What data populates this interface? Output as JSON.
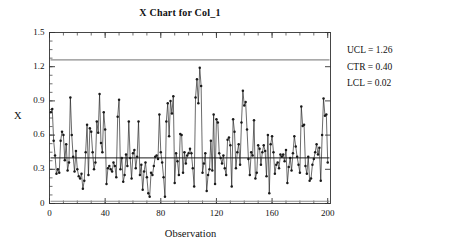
{
  "chart_data": {
    "type": "line",
    "title": "X Chart for Col_1",
    "xlabel": "Observation",
    "ylabel": "X",
    "xlim": [
      0,
      202
    ],
    "ylim": [
      0,
      1.5
    ],
    "grid": false,
    "legend": "none",
    "xticks": [
      0,
      40,
      80,
      120,
      160,
      200
    ],
    "xtick_labels": [
      "0",
      "40",
      "80",
      "120",
      "160",
      "200"
    ],
    "yticks": [
      0,
      0.3,
      0.6,
      0.9,
      1.2,
      1.5
    ],
    "ytick_labels": [
      "0",
      "0.3",
      "0.6",
      "0.9",
      "1.2",
      "1.5"
    ],
    "x_minor_tick_step": 10,
    "y_minor_tick_step": 0.075,
    "control_lines": [
      {
        "name": "UCL",
        "label": "UCL = 1.26",
        "value": 1.26,
        "color": "#8c8c8c"
      },
      {
        "name": "CTR",
        "label": "CTR = 0.40",
        "value": 0.4,
        "color": "#1a1a1a"
      },
      {
        "name": "LCL",
        "label": "LCL = 0.02",
        "value": 0.02,
        "color": "#8c8c8c"
      }
    ],
    "series": [
      {
        "name": "Col_1",
        "marker": "filled-circle",
        "color": "#1a1a1a",
        "x": [
          1,
          2,
          3,
          4,
          5,
          6,
          7,
          8,
          9,
          10,
          11,
          12,
          13,
          14,
          15,
          16,
          17,
          18,
          19,
          20,
          21,
          22,
          23,
          24,
          25,
          26,
          27,
          28,
          29,
          30,
          31,
          32,
          33,
          34,
          35,
          36,
          37,
          38,
          39,
          40,
          41,
          42,
          43,
          44,
          45,
          46,
          47,
          48,
          49,
          50,
          51,
          52,
          53,
          54,
          55,
          56,
          57,
          58,
          59,
          60,
          61,
          62,
          63,
          64,
          65,
          66,
          67,
          68,
          69,
          70,
          71,
          72,
          73,
          74,
          75,
          76,
          77,
          78,
          79,
          80,
          81,
          82,
          83,
          84,
          85,
          86,
          87,
          88,
          89,
          90,
          91,
          92,
          93,
          94,
          95,
          96,
          97,
          98,
          99,
          100,
          101,
          102,
          103,
          104,
          105,
          106,
          107,
          108,
          109,
          110,
          111,
          112,
          113,
          114,
          115,
          116,
          117,
          118,
          119,
          120,
          121,
          122,
          123,
          124,
          125,
          126,
          127,
          128,
          129,
          130,
          131,
          132,
          133,
          134,
          135,
          136,
          137,
          138,
          139,
          140,
          141,
          142,
          143,
          144,
          145,
          146,
          147,
          148,
          149,
          150,
          151,
          152,
          153,
          154,
          155,
          156,
          157,
          158,
          159,
          160,
          161,
          162,
          163,
          164,
          165,
          166,
          167,
          168,
          169,
          170,
          171,
          172,
          173,
          174,
          175,
          176,
          177,
          178,
          179,
          180,
          181,
          182,
          183,
          184,
          185,
          186,
          187,
          188,
          189,
          190,
          191,
          192,
          193,
          194,
          195,
          196,
          197,
          198,
          199,
          200
        ],
        "values": [
          0.8,
          0.83,
          0.55,
          0.42,
          0.26,
          0.3,
          0.27,
          0.55,
          0.63,
          0.6,
          0.38,
          0.52,
          0.29,
          0.36,
          0.93,
          0.6,
          0.41,
          0.28,
          0.46,
          0.3,
          0.24,
          0.22,
          0.26,
          0.13,
          0.2,
          0.45,
          0.69,
          0.25,
          0.66,
          0.63,
          0.45,
          0.3,
          0.36,
          0.72,
          0.62,
          0.96,
          0.53,
          0.45,
          0.8,
          0.65,
          0.17,
          0.31,
          0.33,
          0.3,
          0.28,
          0.36,
          0.33,
          0.23,
          0.76,
          0.91,
          0.3,
          0.4,
          0.19,
          0.25,
          0.43,
          0.33,
          0.72,
          0.4,
          0.22,
          0.44,
          0.47,
          0.31,
          0.41,
          0.72,
          0.25,
          0.34,
          0.12,
          0.28,
          0.36,
          0.23,
          0.09,
          0.06,
          0.27,
          0.25,
          0.33,
          0.41,
          0.42,
          0.39,
          0.78,
          0.45,
          0.36,
          0.23,
          0.06,
          0.72,
          0.88,
          0.59,
          0.9,
          0.79,
          0.94,
          0.18,
          0.44,
          0.37,
          0.25,
          0.61,
          0.6,
          0.27,
          0.45,
          0.35,
          0.42,
          0.44,
          0.48,
          0.44,
          0.31,
          0.15,
          0.93,
          1.09,
          0.88,
          1.19,
          1.03,
          0.27,
          0.35,
          0.44,
          0.11,
          0.25,
          0.3,
          0.55,
          0.29,
          0.78,
          0.17,
          0.74,
          0.71,
          0.44,
          0.4,
          0.35,
          0.42,
          0.31,
          0.25,
          0.56,
          0.58,
          0.51,
          0.15,
          0.74,
          0.63,
          0.31,
          0.45,
          0.52,
          0.34,
          0.71,
          0.99,
          0.86,
          0.89,
          0.65,
          0.39,
          0.25,
          0.45,
          0.42,
          0.73,
          0.22,
          0.27,
          0.51,
          0.48,
          0.34,
          0.45,
          0.51,
          0.46,
          0.24,
          0.6,
          0.09,
          0.52,
          0.59,
          0.45,
          0.26,
          0.34,
          0.36,
          0.31,
          0.43,
          0.41,
          0.43,
          0.37,
          0.47,
          0.18,
          0.32,
          0.4,
          0.29,
          0.44,
          0.59,
          0.5,
          0.41,
          0.34,
          0.27,
          0.85,
          0.68,
          0.69,
          0.33,
          0.26,
          0.41,
          0.2,
          0.22,
          0.34,
          0.39,
          0.45,
          0.52,
          0.43,
          0.49,
          0.2,
          0.6,
          0.92,
          0.77,
          0.78,
          0.36
        ]
      }
    ]
  },
  "annotations": {
    "ucl": "UCL = 1.26",
    "ctr": "CTR = 0.40",
    "lcl": "LCL = 0.02"
  }
}
